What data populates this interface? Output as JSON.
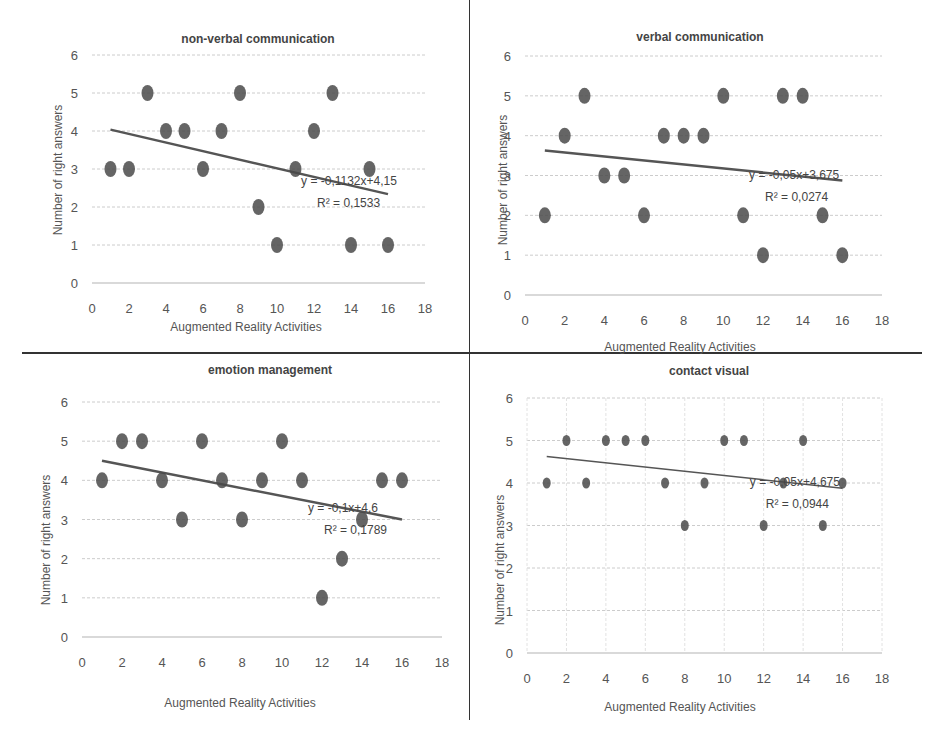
{
  "chart_data": [
    {
      "type": "scatter",
      "title": "non-verbal communication",
      "xlabel": "Augmented Reality Activities",
      "ylabel": "Number of right answers",
      "xlim": [
        0,
        18
      ],
      "ylim": [
        0,
        6
      ],
      "xticks": [
        0,
        2,
        4,
        6,
        8,
        10,
        12,
        14,
        16,
        18
      ],
      "yticks": [
        0,
        1,
        2,
        3,
        4,
        5,
        6
      ],
      "grid": "horizontal",
      "x": [
        1,
        2,
        3,
        4,
        5,
        6,
        7,
        8,
        9,
        10,
        11,
        12,
        13,
        14,
        15,
        16
      ],
      "y": [
        3,
        3,
        5,
        4,
        4,
        3,
        4,
        5,
        2,
        1,
        3,
        4,
        5,
        1,
        3,
        1
      ],
      "trendline": {
        "slope": -0.1132,
        "intercept": 4.15,
        "equation": "y = -0,1132x+4,15",
        "r2_label": "R² = 0,1533"
      }
    },
    {
      "type": "scatter",
      "title": "verbal communication",
      "xlabel": "Augmented Reality Activities",
      "ylabel": "Number of right answers",
      "xlim": [
        0,
        18
      ],
      "ylim": [
        0,
        6
      ],
      "xticks": [
        0,
        2,
        4,
        6,
        8,
        10,
        12,
        14,
        16,
        18
      ],
      "yticks": [
        0,
        1,
        2,
        3,
        4,
        5,
        6
      ],
      "grid": "horizontal",
      "x": [
        1,
        2,
        3,
        4,
        5,
        6,
        7,
        8,
        9,
        10,
        11,
        12,
        13,
        14,
        15,
        16
      ],
      "y": [
        2,
        4,
        5,
        3,
        3,
        2,
        4,
        4,
        4,
        5,
        2,
        1,
        5,
        5,
        2,
        1
      ],
      "trendline": {
        "slope": -0.05,
        "intercept": 3.675,
        "equation": "y = -0,05x+3,675",
        "r2_label": "R² = 0,0274"
      }
    },
    {
      "type": "scatter",
      "title": "emotion management",
      "xlabel": "Augmented Reality Activities",
      "ylabel": "Number of right answers",
      "xlim": [
        0,
        18
      ],
      "ylim": [
        0,
        6
      ],
      "xticks": [
        0,
        2,
        4,
        6,
        8,
        10,
        12,
        14,
        16,
        18
      ],
      "yticks": [
        0,
        1,
        2,
        3,
        4,
        5,
        6
      ],
      "grid": "horizontal",
      "x": [
        1,
        2,
        3,
        4,
        5,
        6,
        7,
        8,
        9,
        10,
        11,
        12,
        13,
        14,
        15,
        16
      ],
      "y": [
        4,
        5,
        5,
        4,
        3,
        5,
        4,
        3,
        4,
        5,
        4,
        1,
        2,
        3,
        4,
        4
      ],
      "trendline": {
        "slope": -0.1,
        "intercept": 4.6,
        "equation": "y = -0,1x+4,6",
        "r2_label": "R² = 0,1789"
      }
    },
    {
      "type": "scatter",
      "title": "contact visual",
      "xlabel": "Augmented Reality Activities",
      "ylabel": "Number of right answers",
      "xlim": [
        0,
        18
      ],
      "ylim": [
        0,
        6
      ],
      "xticks": [
        0,
        2,
        4,
        6,
        8,
        10,
        12,
        14,
        16,
        18
      ],
      "yticks": [
        0,
        1,
        2,
        3,
        4,
        5,
        6
      ],
      "grid": "both",
      "x": [
        1,
        2,
        3,
        4,
        5,
        6,
        7,
        8,
        9,
        10,
        11,
        12,
        13,
        14,
        15,
        16
      ],
      "y": [
        4,
        5,
        4,
        5,
        5,
        5,
        4,
        3,
        4,
        5,
        5,
        3,
        4,
        5,
        3,
        4
      ],
      "trendline": {
        "slope": -0.05,
        "intercept": 4.675,
        "equation": "y = -0,05x+4,675",
        "r2_label": "R² = 0,0944"
      }
    }
  ],
  "colors": {
    "point": "#4a4a4a",
    "trend": "#555555",
    "grid": "#cccccc",
    "divider": "#333333"
  }
}
